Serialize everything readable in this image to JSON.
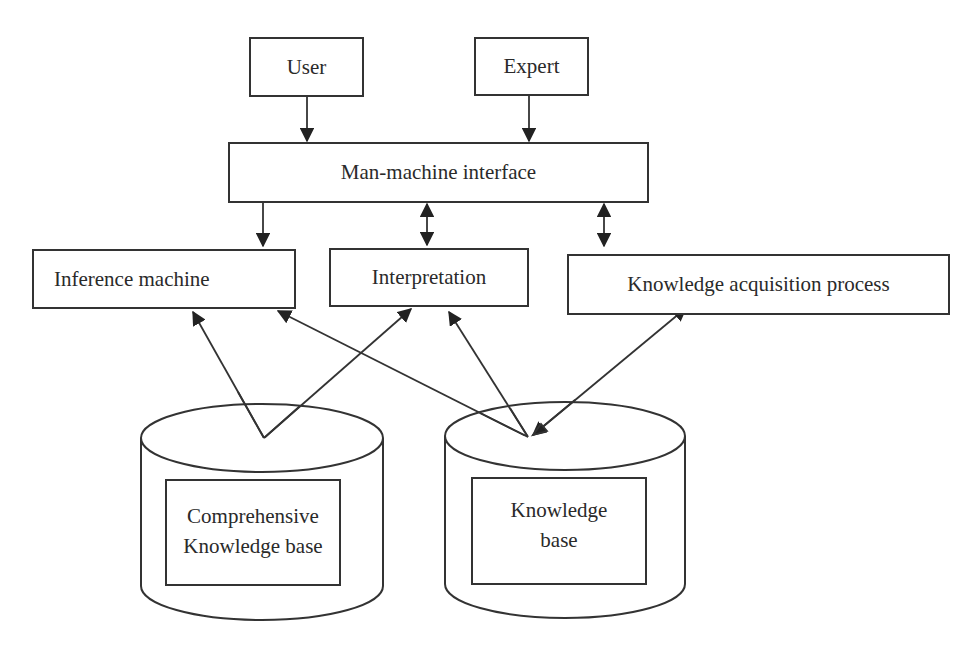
{
  "diagram": {
    "nodes": {
      "user": {
        "label": "User"
      },
      "expert": {
        "label": "Expert"
      },
      "interface": {
        "label": "Man-machine interface"
      },
      "inference": {
        "label": "Inference machine"
      },
      "interpretation": {
        "label": "Interpretation"
      },
      "acquisition": {
        "label": "Knowledge acquisition process"
      },
      "comprehensive_kb": {
        "label_line1": "Comprehensive",
        "label_line2": "Knowledge base"
      },
      "kb": {
        "label_line1": "Knowledge",
        "label_line2": "base"
      }
    },
    "edges": [
      {
        "from": "User",
        "to": "Man-machine interface",
        "type": "one-way"
      },
      {
        "from": "Expert",
        "to": "Man-machine interface",
        "type": "one-way"
      },
      {
        "from": "Man-machine interface",
        "to": "Inference machine",
        "type": "one-way"
      },
      {
        "from": "Man-machine interface",
        "to": "Interpretation",
        "type": "two-way"
      },
      {
        "from": "Man-machine interface",
        "to": "Knowledge acquisition process",
        "type": "two-way"
      },
      {
        "from": "Comprehensive Knowledge base",
        "to": "Inference machine",
        "type": "one-way"
      },
      {
        "from": "Comprehensive Knowledge base",
        "to": "Interpretation",
        "type": "one-way"
      },
      {
        "from": "Knowledge base",
        "to": "Inference machine",
        "type": "one-way"
      },
      {
        "from": "Knowledge base",
        "to": "Interpretation",
        "type": "one-way"
      },
      {
        "from": "Knowledge base",
        "to": "Knowledge acquisition process",
        "type": "two-way"
      }
    ]
  }
}
